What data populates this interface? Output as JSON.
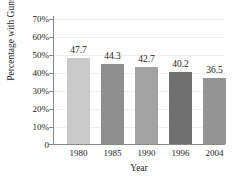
{
  "chart_data": {
    "type": "bar",
    "title": "Guns in Gang Homes",
    "xlabel": "Year",
    "ylabel": "Percentage with Guns",
    "categories": [
      "1980",
      "1985",
      "1990",
      "1996",
      "2004"
    ],
    "values": [
      47.7,
      44.3,
      42.7,
      40.2,
      36.5
    ],
    "value_labels": [
      "47.7",
      "44.3",
      "42.7",
      "40.2",
      "36.5"
    ],
    "ylim": [
      0,
      70
    ],
    "ytick_labels": [
      "70%",
      "60%",
      "50%",
      "40%",
      "30%",
      "20%",
      "10%",
      "0"
    ],
    "ytick_values": [
      70,
      60,
      50,
      40,
      30,
      20,
      10,
      0
    ],
    "grid": true,
    "legend": "none",
    "bar_colors": [
      "#c9c9c9",
      "#8e8e8e",
      "#a2a2a2",
      "#6f6f6f",
      "#949494"
    ],
    "axis_color": "#8a8a8a",
    "grid_color": "#f0efec",
    "text_color": "#1b1b1b",
    "background": "#ffffff"
  }
}
